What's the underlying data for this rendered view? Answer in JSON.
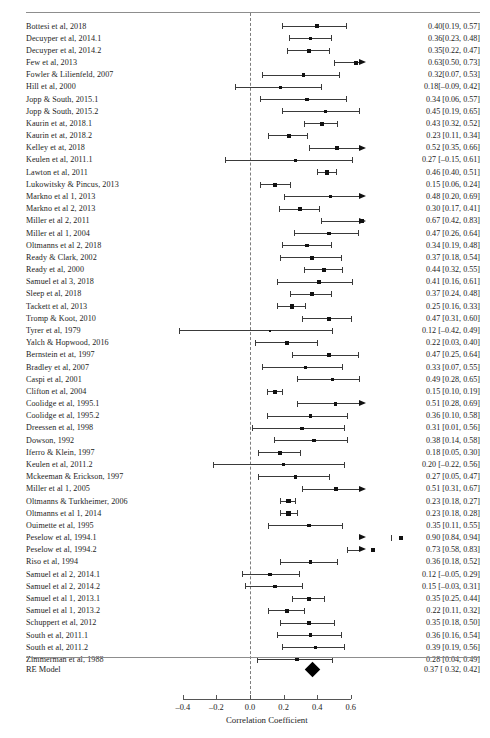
{
  "chart_data": {
    "type": "forest",
    "title": "",
    "xlabel": "Correlation Coefficient",
    "ylabel": "",
    "xlim": [
      -0.5,
      0.68
    ],
    "xticks": [
      -0.4,
      -0.2,
      0.0,
      0.2,
      0.4,
      0.6
    ],
    "xtick_labels": [
      "–0.4",
      "–0.2",
      "0.0",
      "0.2",
      "0.4",
      "0.6"
    ],
    "grid": false,
    "reference_line": 0.0,
    "effect_measure": "Correlation Coefficient",
    "model_label": "RE Model",
    "summary": {
      "label": "RE Model",
      "estimate": 0.37,
      "ci_low": 0.32,
      "ci_high": 0.42,
      "text": "0.37 [ 0.32, 0.42]"
    },
    "studies": [
      {
        "label": "Bottesi et al, 2018",
        "estimate": 0.4,
        "ci_low": 0.19,
        "ci_high": 0.57,
        "text": "0.40[0.19, 0.57]"
      },
      {
        "label": "Decuyper et al, 2014.1",
        "estimate": 0.36,
        "ci_low": 0.23,
        "ci_high": 0.48,
        "text": "0.36[0.23, 0.48]"
      },
      {
        "label": "Decuyper et al, 2014.2",
        "estimate": 0.35,
        "ci_low": 0.22,
        "ci_high": 0.47,
        "text": "0.35[0.22, 0.47]"
      },
      {
        "label": "Few et al, 2013",
        "estimate": 0.63,
        "ci_low": 0.5,
        "ci_high": 0.73,
        "text": "0.63[0.50, 0.73]"
      },
      {
        "label": "Fowler & Lilienfeld, 2007",
        "estimate": 0.32,
        "ci_low": 0.07,
        "ci_high": 0.53,
        "text": "0.32[0.07, 0.53]"
      },
      {
        "label": "Hill et al, 2000",
        "estimate": 0.18,
        "ci_low": -0.09,
        "ci_high": 0.42,
        "text": "0.18[–0.09, 0.42]"
      },
      {
        "label": "Jopp & South, 2015.1",
        "estimate": 0.34,
        "ci_low": 0.06,
        "ci_high": 0.57,
        "text": "0.34 [0.06, 0.57]"
      },
      {
        "label": "Jopp & South, 2015.2",
        "estimate": 0.45,
        "ci_low": 0.19,
        "ci_high": 0.65,
        "text": "0.45 [0.19, 0.65]"
      },
      {
        "label": "Kaurin et at, 2018.1",
        "estimate": 0.43,
        "ci_low": 0.32,
        "ci_high": 0.52,
        "text": "0.43 [0.32, 0.52]"
      },
      {
        "label": "Kaurin et at, 2018.2",
        "estimate": 0.23,
        "ci_low": 0.11,
        "ci_high": 0.34,
        "text": "0.23 [0.11, 0.34]"
      },
      {
        "label": "Kelley et at, 2018",
        "estimate": 0.52,
        "ci_low": 0.35,
        "ci_high": 0.66,
        "text": "0.52 [0.35, 0.66]"
      },
      {
        "label": "Keulen et al, 2011.1",
        "estimate": 0.27,
        "ci_low": -0.15,
        "ci_high": 0.61,
        "text": "0.27 [–0.15, 0.61]"
      },
      {
        "label": "Lawton et al, 2011",
        "estimate": 0.46,
        "ci_low": 0.4,
        "ci_high": 0.51,
        "text": "0.46 [0.40, 0.51]"
      },
      {
        "label": "Lukowitsky & Pincus, 2013",
        "estimate": 0.15,
        "ci_low": 0.06,
        "ci_high": 0.24,
        "text": "0.15 [0.06, 0.24]"
      },
      {
        "label": "Markno et al 1, 2013",
        "estimate": 0.48,
        "ci_low": 0.2,
        "ci_high": 0.69,
        "text": "0.48 [0.20, 0.69]"
      },
      {
        "label": "Markno et al 2, 2013",
        "estimate": 0.3,
        "ci_low": 0.17,
        "ci_high": 0.41,
        "text": "0.30 [0.17, 0.41]"
      },
      {
        "label": "Miller et al 2, 2011",
        "estimate": 0.67,
        "ci_low": 0.42,
        "ci_high": 0.83,
        "text": "0.67 [0.42, 0.83]"
      },
      {
        "label": "Miller et al 1, 2004",
        "estimate": 0.47,
        "ci_low": 0.26,
        "ci_high": 0.64,
        "text": "0.47 [0.26, 0.64]"
      },
      {
        "label": "Oltmanns  et al 2, 2018",
        "estimate": 0.34,
        "ci_low": 0.19,
        "ci_high": 0.48,
        "text": "0.34 [0.19, 0.48]"
      },
      {
        "label": "Ready & Clark, 2002",
        "estimate": 0.37,
        "ci_low": 0.18,
        "ci_high": 0.54,
        "text": "0.37 [0.18, 0.54]"
      },
      {
        "label": "Ready et al, 2000",
        "estimate": 0.44,
        "ci_low": 0.32,
        "ci_high": 0.55,
        "text": "0.44 [0.32, 0.55]"
      },
      {
        "label": "Samuel et al 3, 2018",
        "estimate": 0.41,
        "ci_low": 0.16,
        "ci_high": 0.61,
        "text": "0.41 [0.16, 0.61]"
      },
      {
        "label": "Sleep et al, 2018",
        "estimate": 0.37,
        "ci_low": 0.24,
        "ci_high": 0.48,
        "text": "0.37 [0.24, 0.48]"
      },
      {
        "label": "Tackett et al, 2013",
        "estimate": 0.25,
        "ci_low": 0.16,
        "ci_high": 0.33,
        "text": "0.25 [0.16, 0.33]"
      },
      {
        "label": "Tromp & Koot, 2010",
        "estimate": 0.47,
        "ci_low": 0.31,
        "ci_high": 0.6,
        "text": "0.47 [0.31, 0.60]"
      },
      {
        "label": "Tyrer et al, 1979",
        "estimate": 0.12,
        "ci_low": -0.42,
        "ci_high": 0.49,
        "text": "0.12 [–0.42, 0.49]"
      },
      {
        "label": "Yalch & Hopwood, 2016",
        "estimate": 0.22,
        "ci_low": 0.03,
        "ci_high": 0.4,
        "text": "0.22 [0.03, 0.40]"
      },
      {
        "label": "Bernstein et at, 1997",
        "estimate": 0.47,
        "ci_low": 0.25,
        "ci_high": 0.64,
        "text": "0.47 [0.25, 0.64]"
      },
      {
        "label": "Bradley et al, 2007",
        "estimate": 0.33,
        "ci_low": 0.07,
        "ci_high": 0.55,
        "text": "0.33 [0.07, 0.55]"
      },
      {
        "label": "Caspi et al, 2001",
        "estimate": 0.49,
        "ci_low": 0.28,
        "ci_high": 0.65,
        "text": "0.49 [0.28, 0.65]"
      },
      {
        "label": "Clifton et al, 2004",
        "estimate": 0.15,
        "ci_low": 0.1,
        "ci_high": 0.19,
        "text": "0.15 [0.10, 0.19]"
      },
      {
        "label": "Coolidge et al, 1995.1",
        "estimate": 0.51,
        "ci_low": 0.28,
        "ci_high": 0.69,
        "text": "0.51 [0.28, 0.69]"
      },
      {
        "label": "Coolidge et al, 1995.2",
        "estimate": 0.36,
        "ci_low": 0.1,
        "ci_high": 0.58,
        "text": "0.36 [0.10, 0.58]"
      },
      {
        "label": "Dreessen et al, 1998",
        "estimate": 0.31,
        "ci_low": 0.01,
        "ci_high": 0.56,
        "text": "0.31 [0.01, 0.56]"
      },
      {
        "label": "Dowson, 1992",
        "estimate": 0.38,
        "ci_low": 0.14,
        "ci_high": 0.58,
        "text": "0.38 [0.14, 0.58]"
      },
      {
        "label": "Iferro & Klein, 1997",
        "estimate": 0.18,
        "ci_low": 0.05,
        "ci_high": 0.3,
        "text": "0.18 [0.05, 0.30]"
      },
      {
        "label": "Keulen et al, 2011.2",
        "estimate": 0.2,
        "ci_low": -0.22,
        "ci_high": 0.56,
        "text": "0.20 [–0.22, 0.56]"
      },
      {
        "label": "Mckeeman & Erickson, 1997",
        "estimate": 0.27,
        "ci_low": 0.05,
        "ci_high": 0.47,
        "text": "0.27 [0.05, 0.47]"
      },
      {
        "label": "Miller et al 1, 2005",
        "estimate": 0.51,
        "ci_low": 0.31,
        "ci_high": 0.67,
        "text": "0.51 [0.31, 0.67]"
      },
      {
        "label": "Oltmanns & Turkheimer, 2006",
        "estimate": 0.23,
        "ci_low": 0.18,
        "ci_high": 0.27,
        "text": "0.23 [0.18, 0.27]"
      },
      {
        "label": "Oltmanns et al 1, 2014",
        "estimate": 0.23,
        "ci_low": 0.18,
        "ci_high": 0.28,
        "text": "0.23 [0.18, 0.28]"
      },
      {
        "label": "Ouimette et al, 1995",
        "estimate": 0.35,
        "ci_low": 0.11,
        "ci_high": 0.55,
        "text": "0.35 [0.11, 0.55]"
      },
      {
        "label": "Peselow et al, 1994.1",
        "estimate": 0.9,
        "ci_low": 0.84,
        "ci_high": 0.94,
        "text": "0.90 [0.84, 0.94]"
      },
      {
        "label": "Peselow et al, 1994.2",
        "estimate": 0.73,
        "ci_low": 0.58,
        "ci_high": 0.83,
        "text": "0.73 [0.58, 0.83]"
      },
      {
        "label": "Riso et al, 1994",
        "estimate": 0.36,
        "ci_low": 0.18,
        "ci_high": 0.52,
        "text": "0.36 [0.18, 0.52]"
      },
      {
        "label": "Samuel et al 2, 2014.1",
        "estimate": 0.12,
        "ci_low": -0.05,
        "ci_high": 0.29,
        "text": "0.12 [–0.05, 0.29]"
      },
      {
        "label": "Samuel et al 2, 2014.2",
        "estimate": 0.15,
        "ci_low": -0.03,
        "ci_high": 0.31,
        "text": "0.15 [–0.03, 0.31]"
      },
      {
        "label": "Samuel et al 1, 2013.1",
        "estimate": 0.35,
        "ci_low": 0.25,
        "ci_high": 0.44,
        "text": "0.35 [0.25, 0.44]"
      },
      {
        "label": "Samuel et al 1, 2013.2",
        "estimate": 0.22,
        "ci_low": 0.11,
        "ci_high": 0.32,
        "text": "0.22 [0.11, 0.32]"
      },
      {
        "label": "Schuppert et al, 2012",
        "estimate": 0.35,
        "ci_low": 0.18,
        "ci_high": 0.5,
        "text": "0.35 [0.18, 0.50]"
      },
      {
        "label": "South et al, 2011.1",
        "estimate": 0.36,
        "ci_low": 0.16,
        "ci_high": 0.54,
        "text": "0.36 [0.16, 0.54]"
      },
      {
        "label": "South et al, 2011.2",
        "estimate": 0.39,
        "ci_low": 0.19,
        "ci_high": 0.56,
        "text": "0.39 [0.19, 0.56]"
      },
      {
        "label": "Zimmerman et al, 1988",
        "estimate": 0.28,
        "ci_low": 0.04,
        "ci_high": 0.49,
        "text": "0.28 [0.04, 0.49]"
      }
    ]
  },
  "layout": {
    "row_start_y": 21.5,
    "row_step": 12.18,
    "plot_left_px": 183,
    "plot_zero_px": 250,
    "plot_scale_px": 168,
    "clip_min": -0.47,
    "clip_max": 0.655,
    "axis_y": 699,
    "axis_title_y": 715,
    "tick_label_y": 703,
    "top_rule_y": 12,
    "bottom_rule_y": 657,
    "summary_y": 665,
    "summary_row_y": 669
  },
  "colors": {
    "ink": "#1c1c1c",
    "rule": "#8d8d8d",
    "line": "#3a3a3a",
    "marker": "#111111",
    "zero_line": "#777777"
  }
}
